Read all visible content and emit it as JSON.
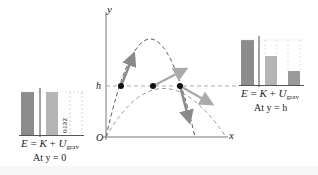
{
  "figure": {
    "axes": {
      "x_label": "x",
      "y_label": "y",
      "origin_label": "O",
      "height_label": "h"
    },
    "trajectories": [
      {
        "name": "steep",
        "description": "high-angle launch parabola",
        "color": "#555555"
      },
      {
        "name": "shallow",
        "description": "low-angle launch parabola",
        "color": "#999999"
      }
    ],
    "points_at_height_h": 3,
    "left_chart": {
      "equation": {
        "E": "E",
        "eq": "=",
        "K": "K",
        "plus": "+",
        "U": "U",
        "U_sub": "grav"
      },
      "caption": "At y = 0",
      "bars": [
        {
          "name": "E",
          "fill": "#8c8c8c",
          "level": 1.0
        },
        {
          "name": "K",
          "fill": "#b5b5b5",
          "level": 1.0
        },
        {
          "name": "U_grav",
          "fill": "none",
          "level": 0,
          "annotation": "zero"
        }
      ]
    },
    "right_chart": {
      "equation": {
        "E": "E",
        "eq": "=",
        "K": "K",
        "plus": "+",
        "U": "U",
        "U_sub": "grav"
      },
      "caption": "At y = h",
      "bars": [
        {
          "name": "E",
          "fill": "#8c8c8c",
          "level": 1.0
        },
        {
          "name": "K",
          "fill": "#b5b5b5",
          "level": 0.64
        },
        {
          "name": "U_grav",
          "fill": "#9a9a9a",
          "level": 0.31
        }
      ]
    },
    "colors": {
      "dark_bar": "#8c8c8c",
      "light_bar": "#b5b5b5",
      "axis": "#666666",
      "arrow_dark": "#8a8a8a",
      "arrow_light": "#aaaaaa"
    }
  }
}
